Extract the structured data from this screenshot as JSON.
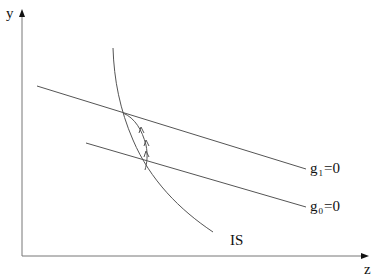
{
  "diagram": {
    "type": "economics IS curve with policy lines",
    "axes": {
      "y_label": "y",
      "x_label": "z"
    },
    "curves": [
      {
        "id": "is_curve",
        "label": "IS",
        "shape": "concave downward-sloping curve"
      },
      {
        "id": "g1_line",
        "label_base": "g",
        "label_sub": "1",
        "label_rest": "=0",
        "shape": "straight downward-sloping line (upper)"
      },
      {
        "id": "g0_line",
        "label_base": "g",
        "label_sub": "0",
        "label_rest": "=0",
        "shape": "straight downward-sloping line (lower)"
      }
    ],
    "path": {
      "description": "adjustment path from lower intersection (g0=0 with IS) to upper intersection (g1=0 with IS) with arrows",
      "arrow_count": 3
    },
    "colors": {
      "line": "#555555",
      "text": "#111111",
      "background": "#ffffff"
    }
  }
}
